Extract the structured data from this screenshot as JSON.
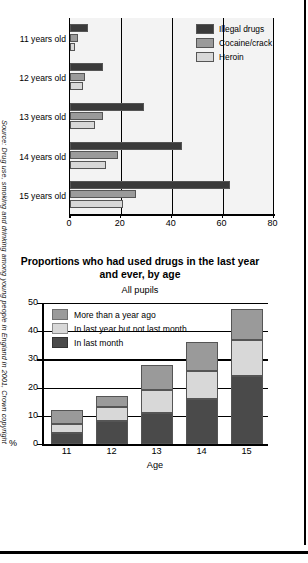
{
  "source_note": "Source: Drug use, smoking and drinking among young people in England in 2001, Crown copyright",
  "top_chart": {
    "legend": [
      {
        "label": "Illegal drugs",
        "color": "#3a3a3a",
        "key": "illegal"
      },
      {
        "label": "Cocaine/crack",
        "color": "#9a9a9a",
        "key": "cocaine"
      },
      {
        "label": "Heroin",
        "color": "#d8d8d8",
        "key": "heroin"
      }
    ],
    "x_ticks": [
      "0",
      "20",
      "40",
      "60",
      "80"
    ],
    "categories": [
      "11 years old",
      "12 years old",
      "13 years old",
      "14 years old",
      "15 years old"
    ]
  },
  "bottom_chart": {
    "title": "Proportions who had used drugs in the last year and ever, by age",
    "subtitle": "All pupils",
    "y_unit": "%",
    "x_axis_title": "Age",
    "y_ticks": [
      "50",
      "40",
      "30",
      "20",
      "10",
      "0"
    ],
    "legend": [
      {
        "label": "More than a year ago",
        "color": "#9a9a9a",
        "key": "more_than_year"
      },
      {
        "label": "In last year but not last month",
        "color": "#d8d8d8",
        "key": "in_last_year"
      },
      {
        "label": "In last month",
        "color": "#4a4a4a",
        "key": "in_last_month"
      }
    ],
    "x_labels": [
      "11",
      "12",
      "13",
      "14",
      "15"
    ]
  },
  "chart_data": [
    {
      "type": "bar",
      "orientation": "horizontal",
      "title": "",
      "xlabel": "",
      "ylabel": "",
      "categories": [
        "11 years old",
        "12 years old",
        "13 years old",
        "14 years old",
        "15 years old"
      ],
      "series": [
        {
          "name": "Illegal drugs",
          "color": "#3a3a3a",
          "values": [
            7,
            13,
            29,
            44,
            63
          ]
        },
        {
          "name": "Cocaine/crack",
          "color": "#9a9a9a",
          "values": [
            3,
            6,
            13,
            19,
            26
          ]
        },
        {
          "name": "Heroin",
          "color": "#d8d8d8",
          "values": [
            2,
            5,
            10,
            14,
            21
          ]
        }
      ],
      "xlim": [
        0,
        80
      ],
      "xticks": [
        0,
        20,
        40,
        60,
        80
      ],
      "grid": true,
      "legend_position": "top-right"
    },
    {
      "type": "bar",
      "stacked": true,
      "orientation": "vertical",
      "title": "Proportions who had used drugs in the last year and ever, by age",
      "subtitle": "All pupils",
      "xlabel": "Age",
      "ylabel": "%",
      "categories": [
        "11",
        "12",
        "13",
        "14",
        "15"
      ],
      "series": [
        {
          "name": "In last month",
          "color": "#4a4a4a",
          "values": [
            4,
            8,
            11,
            16,
            24
          ]
        },
        {
          "name": "In last year but not last month",
          "color": "#d8d8d8",
          "values": [
            3,
            5,
            8,
            10,
            13
          ]
        },
        {
          "name": "More than a year ago",
          "color": "#9a9a9a",
          "values": [
            5,
            4,
            9,
            10,
            11
          ]
        }
      ],
      "totals": [
        12,
        17,
        28,
        36,
        48
      ],
      "ylim": [
        0,
        50
      ],
      "yticks": [
        0,
        10,
        20,
        30,
        40,
        50
      ],
      "grid": true,
      "legend_position": "top-left"
    }
  ]
}
